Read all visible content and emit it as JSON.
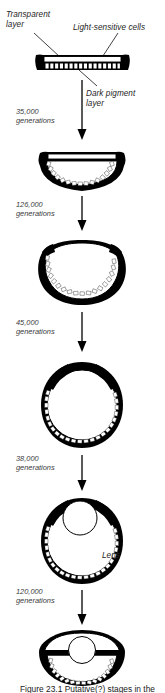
{
  "figure": {
    "title_caption": "Figure 23.1 Putative(?) stages in the evolution of the eye",
    "annotations": [
      {
        "name": "transparent-layer",
        "text_line1": "Transparent",
        "text_line2": "layer"
      },
      {
        "name": "light-sensitive-cells",
        "text_line1": "Light-sensitive cells",
        "text_line2": ""
      },
      {
        "name": "dark-pigment-layer",
        "text_line1": "Dark pigment",
        "text_line2": "layer"
      },
      {
        "name": "lens",
        "text_line1": "Lens",
        "text_line2": ""
      }
    ],
    "generation_steps": [
      {
        "number": "35,000",
        "unit": "generations"
      },
      {
        "number": "126,000",
        "unit": "generations"
      },
      {
        "number": "45,000",
        "unit": "generations"
      },
      {
        "number": "38,000",
        "unit": "generations"
      },
      {
        "number": "120,000",
        "unit": "generations"
      }
    ],
    "stages": [
      {
        "name": "stage-flat-eyespot",
        "description": "Flat patch of light-sensitive cells with transparent layer above and dark pigment layer below"
      },
      {
        "name": "stage-shallow-cup",
        "description": "Shallow cup-shaped retina"
      },
      {
        "name": "stage-deep-cup",
        "description": "Deep cup with narrowing aperture"
      },
      {
        "name": "stage-pinhole",
        "description": "Nearly closed spherical chamber with pinhole aperture"
      },
      {
        "name": "stage-lens-forming",
        "description": "Chamber with refractive lens forming at aperture"
      },
      {
        "name": "stage-complex-eye",
        "description": "Complex eye with focused lens and iris"
      }
    ],
    "colors": {
      "ink": "#000000",
      "paper": "#ffffff",
      "text": "#1a1a1a"
    }
  }
}
